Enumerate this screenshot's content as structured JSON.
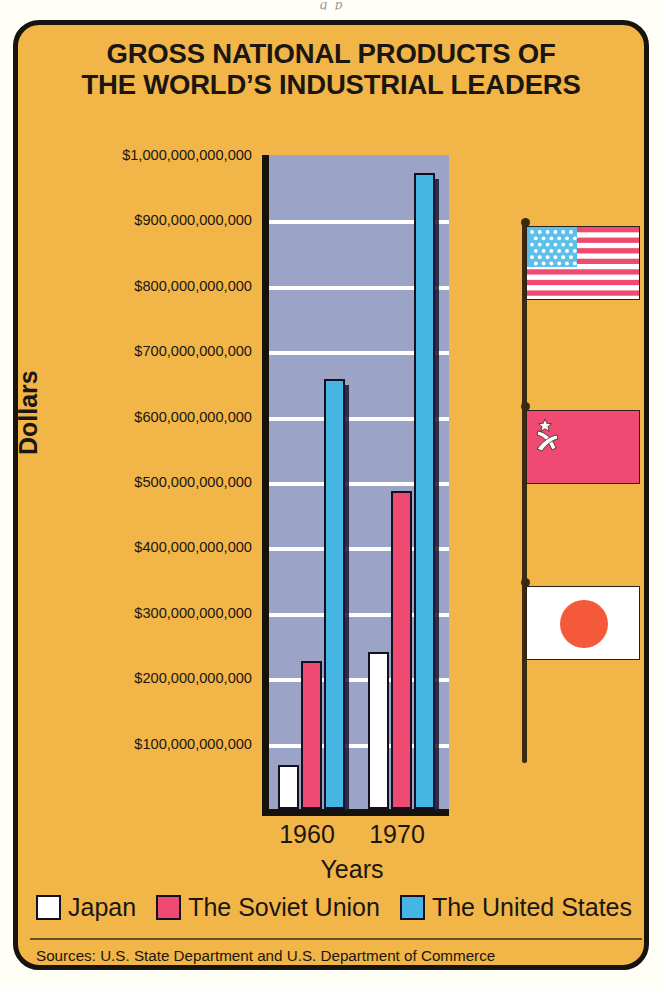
{
  "page_remnant": "g                 p",
  "card": {
    "background_color": "#f2b547",
    "border_color": "#17130d"
  },
  "title": {
    "line1": "GROSS NATIONAL PRODUCTS OF",
    "line2": "THE WORLD’S INDUSTRIAL LEADERS"
  },
  "axis": {
    "ylabel": "Dollars",
    "xlabel": "Years"
  },
  "legend": [
    {
      "label": "Japan",
      "color": "#ffffff"
    },
    {
      "label": "The Soviet Union",
      "color": "#ef4a72"
    },
    {
      "label": "The United States",
      "color": "#45b6e4"
    }
  ],
  "sources": "Sources: U.S. State Department and U.S. Department of Commerce",
  "flags": [
    {
      "name": "united-states-flag",
      "country": "The United States"
    },
    {
      "name": "soviet-union-flag",
      "country": "The Soviet Union"
    },
    {
      "name": "japan-flag",
      "country": "Japan"
    }
  ],
  "chart_data": {
    "type": "bar",
    "title": "GROSS NATIONAL PRODUCTS OF THE WORLD’S INDUSTRIAL LEADERS",
    "xlabel": "Years",
    "ylabel": "Dollars",
    "categories": [
      "1960",
      "1970"
    ],
    "tick_labels": [
      "$100,000,000,000",
      "$200,000,000,000",
      "$300,000,000,000",
      "$400,000,000,000",
      "$500,000,000,000",
      "$600,000,000,000",
      "$700,000,000,000",
      "$800,000,000,000",
      "$900,000,000,000",
      "$1,000,000,000,000"
    ],
    "tick_values": [
      100000000000,
      200000000000,
      300000000000,
      400000000000,
      500000000000,
      600000000000,
      700000000000,
      800000000000,
      900000000000,
      1000000000000
    ],
    "ylim": [
      0,
      1000000000000
    ],
    "grid": true,
    "legend_position": "bottom",
    "plot_background": "#9ba3c6",
    "series": [
      {
        "name": "Japan",
        "color": "#ffffff",
        "values": [
          68000000000,
          240000000000
        ]
      },
      {
        "name": "The Soviet Union",
        "color": "#ef4a72",
        "values": [
          226000000000,
          487000000000
        ]
      },
      {
        "name": "The United States",
        "color": "#45b6e4",
        "values": [
          658000000000,
          973000000000
        ]
      }
    ]
  }
}
